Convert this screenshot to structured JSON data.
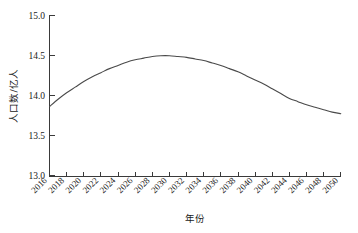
{
  "chart_data": {
    "type": "line",
    "title": "",
    "xlabel": "年份",
    "ylabel": "人口数/亿人",
    "xlim": [
      2016,
      2050
    ],
    "ylim": [
      13.0,
      15.0
    ],
    "grid": false,
    "legend": false,
    "line_color": "#4a4a4a",
    "background_color": "#ffffff",
    "x_tick_labels": [
      "2016",
      "2018",
      "2020",
      "2022",
      "2024",
      "2026",
      "2028",
      "2030",
      "2032",
      "2034",
      "2036",
      "2038",
      "2040",
      "2042",
      "2044",
      "2046",
      "2048",
      "2050"
    ],
    "y_tick_labels": [
      "13.0",
      "13.5",
      "14.0",
      "14.5",
      "15.0"
    ],
    "y_tick_values": [
      13.0,
      13.5,
      14.0,
      14.5,
      15.0
    ],
    "x": [
      2016,
      2017,
      2018,
      2019,
      2020,
      2021,
      2022,
      2023,
      2024,
      2025,
      2026,
      2027,
      2028,
      2029,
      2030,
      2031,
      2032,
      2033,
      2034,
      2035,
      2036,
      2037,
      2038,
      2039,
      2040,
      2041,
      2042,
      2043,
      2044,
      2045,
      2046,
      2047,
      2048,
      2049,
      2050
    ],
    "values": [
      13.87,
      13.96,
      14.04,
      14.11,
      14.18,
      14.24,
      14.29,
      14.34,
      14.38,
      14.42,
      14.45,
      14.47,
      14.49,
      14.5,
      14.5,
      14.49,
      14.48,
      14.46,
      14.44,
      14.41,
      14.38,
      14.34,
      14.3,
      14.25,
      14.2,
      14.15,
      14.09,
      14.03,
      13.86,
      13.97,
      13.93,
      13.89,
      13.85,
      13.81,
      13.78
    ],
    "series": [
      {
        "name": "人口数",
        "values": [
          13.87,
          13.96,
          14.04,
          14.11,
          14.18,
          14.24,
          14.29,
          14.34,
          14.38,
          14.42,
          14.45,
          14.47,
          14.49,
          14.5,
          14.5,
          14.49,
          14.48,
          14.46,
          14.44,
          14.41,
          14.38,
          14.34,
          14.3,
          14.25,
          14.2,
          14.15,
          14.09,
          14.03,
          13.97,
          13.93,
          13.89,
          13.86,
          13.83,
          13.8,
          13.78
        ]
      }
    ],
    "peak": {
      "x": 2029,
      "y": 14.5
    },
    "start_point": {
      "x": 2016,
      "y": 13.87
    },
    "end_point": {
      "x": 2050,
      "y": 13.78
    }
  }
}
